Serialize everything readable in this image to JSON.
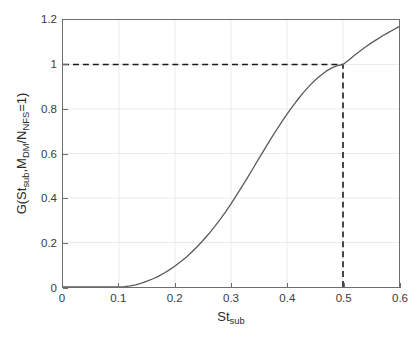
{
  "chart_data": {
    "type": "line",
    "title": "",
    "xlabel": "St_sub",
    "xlabel_base": "St",
    "xlabel_sub": "sub",
    "ylabel": "G(St_sub,M_DM/N_NFS=1)",
    "xlim": [
      0,
      0.6
    ],
    "ylim": [
      0,
      1.2
    ],
    "grid": true,
    "legend": null,
    "xticks": [
      0,
      0.1,
      0.2,
      0.3,
      0.4,
      0.5,
      0.6
    ],
    "xtick_labels": [
      "0",
      "0.1",
      "0.2",
      "0.3",
      "0.4",
      "0.5",
      "0.6"
    ],
    "yticks": [
      0,
      0.2,
      0.4,
      0.6,
      0.8,
      1,
      1.2
    ],
    "ytick_labels": [
      "0",
      "0.2",
      "0.4",
      "0.6",
      "0.8",
      "1",
      "1.2"
    ],
    "series": [
      {
        "name": "G",
        "color": "#5a5a5a",
        "linewidth": 1.3,
        "style": "solid",
        "x": [
          0.0,
          0.02,
          0.04,
          0.06,
          0.08,
          0.1,
          0.11,
          0.12,
          0.13,
          0.14,
          0.15,
          0.16,
          0.17,
          0.18,
          0.19,
          0.2,
          0.21,
          0.22,
          0.23,
          0.24,
          0.25,
          0.26,
          0.27,
          0.28,
          0.29,
          0.3,
          0.31,
          0.32,
          0.33,
          0.34,
          0.35,
          0.36,
          0.37,
          0.38,
          0.39,
          0.4,
          0.41,
          0.42,
          0.43,
          0.44,
          0.45,
          0.46,
          0.47,
          0.48,
          0.49,
          0.5,
          0.51,
          0.52,
          0.53,
          0.54,
          0.55,
          0.56,
          0.57,
          0.58,
          0.59,
          0.6
        ],
        "y": [
          0.0,
          0.0,
          0.0,
          0.0,
          0.0,
          0.0,
          0.002,
          0.005,
          0.01,
          0.017,
          0.026,
          0.036,
          0.048,
          0.062,
          0.077,
          0.094,
          0.113,
          0.134,
          0.157,
          0.182,
          0.209,
          0.238,
          0.269,
          0.302,
          0.337,
          0.374,
          0.413,
          0.453,
          0.494,
          0.536,
          0.578,
          0.62,
          0.661,
          0.701,
          0.74,
          0.777,
          0.812,
          0.845,
          0.876,
          0.904,
          0.929,
          0.951,
          0.97,
          0.985,
          0.995,
          1.0,
          1.019,
          1.04,
          1.06,
          1.079,
          1.096,
          1.112,
          1.128,
          1.142,
          1.156,
          1.17
        ]
      }
    ],
    "annotations": [
      {
        "name": "horizontal-guide",
        "type": "dashed-line",
        "orientation": "horizontal",
        "value": 1.0,
        "from": 0.0,
        "to": 0.5,
        "color": "#1a1a1a"
      },
      {
        "name": "vertical-guide",
        "type": "dashed-line",
        "orientation": "vertical",
        "value": 0.5,
        "from": 0.0,
        "to": 1.0,
        "color": "#1a1a1a"
      }
    ],
    "marked_point": {
      "x": 0.5,
      "y": 1.0
    }
  },
  "colors": {
    "axis": "#6e6e6e",
    "grid": "#ebebeb",
    "curve": "#5a5a5a",
    "dashed": "#1a1a1a",
    "text": "#3a3a3a",
    "background": "#ffffff"
  }
}
